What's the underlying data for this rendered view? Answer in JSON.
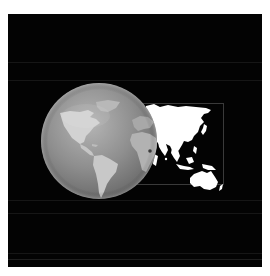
{
  "image": {
    "description": "Shaded grayscale globe showing the Americas, Europe and Africa, overlapping a flat white map of Asia and Australia inside a thin gray frame, on a black background",
    "background_color": "#030303",
    "margin_color": "#ffffff",
    "globe": {
      "visible_continents": [
        "North America",
        "South America",
        "Greenland",
        "Europe",
        "Africa"
      ],
      "base_color": "#8a8a8a",
      "highlight_color": "#bdbdbd",
      "land_color": "#c4c4c4"
    },
    "flat_map": {
      "visible_continents": [
        "Asia",
        "Australia",
        "Indonesia",
        "Japan"
      ],
      "land_color": "#ffffff",
      "frame_color": "#3a3a3a"
    }
  }
}
